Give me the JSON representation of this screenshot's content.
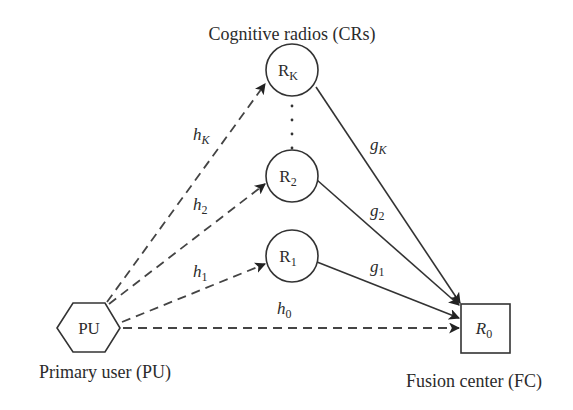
{
  "diagram": {
    "title": "Cognitive radios (CRs)",
    "nodes": {
      "primary_user": {
        "label": "PU",
        "caption": "Primary user (PU)",
        "shape": "hexagon"
      },
      "cr_k": {
        "label": "R",
        "sub": "K",
        "shape": "circle"
      },
      "cr_2": {
        "label": "R",
        "sub": "2",
        "shape": "circle"
      },
      "cr_1": {
        "label": "R",
        "sub": "1",
        "shape": "circle"
      },
      "fusion_center": {
        "label": "R",
        "sub": "0",
        "caption": "Fusion center (FC)",
        "shape": "square"
      }
    },
    "edges": {
      "h_k": {
        "label": "h",
        "sub": "K",
        "from": "PU",
        "to": "R_K",
        "style": "dashed"
      },
      "h_2": {
        "label": "h",
        "sub": "2",
        "from": "PU",
        "to": "R_2",
        "style": "dashed"
      },
      "h_1": {
        "label": "h",
        "sub": "1",
        "from": "PU",
        "to": "R_1",
        "style": "dashed"
      },
      "h_0": {
        "label": "h",
        "sub": "0",
        "from": "PU",
        "to": "R_0",
        "style": "dashed"
      },
      "g_k": {
        "label": "g",
        "sub": "K",
        "from": "R_K",
        "to": "R_0",
        "style": "solid"
      },
      "g_2": {
        "label": "g",
        "sub": "2",
        "from": "R_2",
        "to": "R_0",
        "style": "solid"
      },
      "g_1": {
        "label": "g",
        "sub": "1",
        "from": "R_1",
        "to": "R_0",
        "style": "solid"
      }
    },
    "ellipsis": "vertical dots between R_2 and R_K"
  }
}
